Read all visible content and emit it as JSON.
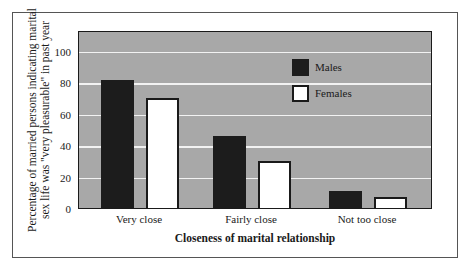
{
  "chart_data": {
    "type": "bar",
    "title": "",
    "xlabel": "Closeness of marital relationship",
    "ylabel": "Percentage of married persons indicating marital sex life was \"very pleasurable\" in past year",
    "ylabel_lines": [
      "Percentage of married persons indicating marital",
      "sex life was \"very pleasurable\" in past year"
    ],
    "categories": [
      "Very close",
      "Fairly close",
      "Not too close"
    ],
    "series": [
      {
        "name": "Males",
        "values": [
          81,
          46,
          11
        ],
        "color": "#1c1c1c"
      },
      {
        "name": "Females",
        "values": [
          70,
          30,
          7
        ],
        "color": "#ffffff"
      }
    ],
    "ylim": [
      0,
      110
    ],
    "yticks": [
      "0",
      "20",
      "40",
      "60",
      "80",
      "100"
    ],
    "grid": true,
    "legend_position": "upper right inside plot",
    "background_color": "#a8a8a8"
  }
}
